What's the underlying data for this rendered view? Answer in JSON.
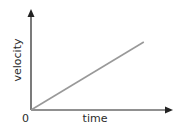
{
  "chart_data": {
    "type": "line",
    "title": "",
    "xlabel": "time",
    "ylabel": "velocity",
    "origin_label": "0",
    "xlim": [
      0,
      1
    ],
    "ylim": [
      0,
      1
    ],
    "grid": false,
    "legend": "none",
    "series": [
      {
        "name": "velocity vs time",
        "x": [
          0,
          0.8
        ],
        "y": [
          0,
          0.68
        ]
      }
    ],
    "colors": {
      "axis": "#222222",
      "line": "#999999",
      "text": "#2b2b2b"
    }
  }
}
